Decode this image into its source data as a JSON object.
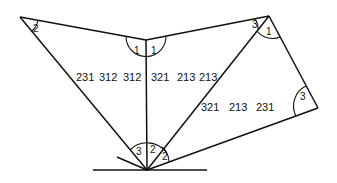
{
  "diagram": {
    "type": "geometric construction",
    "ground_line": {
      "x1": 93,
      "y1": 170,
      "x2": 207,
      "y2": 170
    },
    "points": {
      "left_apex": [
        20,
        17
      ],
      "top_center": [
        146,
        40
      ],
      "right_apex": [
        269,
        16
      ],
      "right_corner": [
        318,
        108
      ],
      "bottom": [
        147,
        170
      ],
      "stub_end": [
        117,
        157
      ]
    },
    "angle_labels": {
      "left_apex": "2",
      "top_center_left": "1",
      "top_center_right": "1",
      "right_apex_left": "3",
      "right_apex_right": "1",
      "right_corner": "3",
      "bottom_left": "3",
      "bottom_middle": "2",
      "bottom_right": "2"
    },
    "sequence_labels": {
      "left_triangle": [
        "231",
        "312",
        "312"
      ],
      "middle_triangle": [
        "321",
        "213",
        "213"
      ],
      "right_quad": [
        "321",
        "213",
        "231"
      ]
    }
  }
}
